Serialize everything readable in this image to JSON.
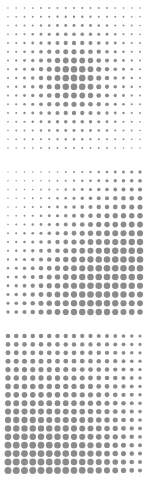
{
  "document": {
    "title": "Dot Matrix Panels",
    "background_color": "#ffffff",
    "width": 150,
    "height": 489,
    "panel_count": 3
  },
  "chart_data": [
    {
      "type": "heatmap",
      "title": "Panel 1 — Concentric Radial Dot Matrix",
      "subtitle": "",
      "xlabel": "",
      "ylabel": "",
      "grid": false,
      "legend": "none",
      "marker": "circle",
      "marker_color": "#8c8c8c",
      "rows": 17,
      "cols": 17,
      "x": [
        1,
        2,
        3,
        4,
        5,
        6,
        7,
        8,
        9,
        10,
        11,
        12,
        13,
        14,
        15,
        16,
        17
      ],
      "y": [
        1,
        2,
        3,
        4,
        5,
        6,
        7,
        8,
        9,
        10,
        11,
        12,
        13,
        14,
        15,
        16,
        17
      ],
      "value_range": [
        0.08,
        1.0
      ],
      "encoding": "marker size proportional to value",
      "pattern": "radial-peak-center",
      "values": [
        [
          0.1,
          0.11,
          0.12,
          0.13,
          0.15,
          0.16,
          0.17,
          0.18,
          0.18,
          0.18,
          0.17,
          0.16,
          0.15,
          0.13,
          0.12,
          0.11,
          0.1
        ],
        [
          0.11,
          0.13,
          0.15,
          0.17,
          0.19,
          0.21,
          0.23,
          0.24,
          0.25,
          0.24,
          0.23,
          0.21,
          0.19,
          0.17,
          0.15,
          0.13,
          0.11
        ],
        [
          0.12,
          0.15,
          0.18,
          0.21,
          0.25,
          0.28,
          0.31,
          0.33,
          0.34,
          0.33,
          0.31,
          0.28,
          0.25,
          0.21,
          0.18,
          0.15,
          0.12
        ],
        [
          0.13,
          0.17,
          0.21,
          0.26,
          0.32,
          0.37,
          0.41,
          0.44,
          0.45,
          0.44,
          0.41,
          0.37,
          0.32,
          0.26,
          0.21,
          0.17,
          0.13
        ],
        [
          0.15,
          0.19,
          0.25,
          0.32,
          0.4,
          0.47,
          0.53,
          0.57,
          0.58,
          0.57,
          0.53,
          0.47,
          0.4,
          0.32,
          0.25,
          0.19,
          0.15
        ],
        [
          0.16,
          0.21,
          0.28,
          0.37,
          0.47,
          0.57,
          0.65,
          0.7,
          0.72,
          0.7,
          0.65,
          0.57,
          0.47,
          0.37,
          0.28,
          0.21,
          0.16
        ],
        [
          0.17,
          0.23,
          0.31,
          0.41,
          0.53,
          0.65,
          0.76,
          0.83,
          0.85,
          0.83,
          0.76,
          0.65,
          0.53,
          0.41,
          0.31,
          0.23,
          0.17
        ],
        [
          0.18,
          0.24,
          0.33,
          0.44,
          0.57,
          0.7,
          0.83,
          0.95,
          0.98,
          0.95,
          0.83,
          0.7,
          0.57,
          0.44,
          0.33,
          0.24,
          0.18
        ],
        [
          0.18,
          0.25,
          0.34,
          0.45,
          0.58,
          0.72,
          0.85,
          0.98,
          1.0,
          0.98,
          0.85,
          0.72,
          0.58,
          0.45,
          0.34,
          0.25,
          0.18
        ],
        [
          0.18,
          0.24,
          0.33,
          0.44,
          0.57,
          0.7,
          0.83,
          0.95,
          0.98,
          0.95,
          0.83,
          0.7,
          0.57,
          0.44,
          0.33,
          0.24,
          0.18
        ],
        [
          0.17,
          0.23,
          0.31,
          0.41,
          0.53,
          0.65,
          0.76,
          0.83,
          0.85,
          0.83,
          0.76,
          0.65,
          0.53,
          0.41,
          0.31,
          0.23,
          0.17
        ],
        [
          0.16,
          0.21,
          0.28,
          0.37,
          0.47,
          0.57,
          0.65,
          0.7,
          0.72,
          0.7,
          0.65,
          0.57,
          0.47,
          0.37,
          0.28,
          0.21,
          0.16
        ],
        [
          0.15,
          0.19,
          0.25,
          0.32,
          0.4,
          0.47,
          0.53,
          0.57,
          0.58,
          0.57,
          0.53,
          0.47,
          0.4,
          0.32,
          0.25,
          0.19,
          0.15
        ],
        [
          0.13,
          0.17,
          0.21,
          0.26,
          0.32,
          0.37,
          0.41,
          0.44,
          0.45,
          0.44,
          0.41,
          0.37,
          0.32,
          0.26,
          0.21,
          0.17,
          0.13
        ],
        [
          0.12,
          0.15,
          0.18,
          0.21,
          0.25,
          0.28,
          0.31,
          0.33,
          0.34,
          0.33,
          0.31,
          0.28,
          0.25,
          0.21,
          0.18,
          0.15,
          0.12
        ],
        [
          0.11,
          0.13,
          0.15,
          0.17,
          0.19,
          0.21,
          0.23,
          0.24,
          0.25,
          0.24,
          0.23,
          0.21,
          0.19,
          0.17,
          0.15,
          0.13,
          0.11
        ],
        [
          0.1,
          0.11,
          0.12,
          0.13,
          0.15,
          0.16,
          0.17,
          0.18,
          0.18,
          0.18,
          0.17,
          0.16,
          0.15,
          0.13,
          0.12,
          0.11,
          0.1
        ]
      ]
    },
    {
      "type": "heatmap",
      "title": "Panel 2 — Diagonal Gradient Dot Matrix (top-left small to bottom-right large)",
      "subtitle": "",
      "xlabel": "",
      "ylabel": "",
      "grid": false,
      "legend": "none",
      "marker": "circle",
      "marker_color": "#8c8c8c",
      "rows": 17,
      "cols": 17,
      "x": [
        1,
        2,
        3,
        4,
        5,
        6,
        7,
        8,
        9,
        10,
        11,
        12,
        13,
        14,
        15,
        16,
        17
      ],
      "y": [
        1,
        2,
        3,
        4,
        5,
        6,
        7,
        8,
        9,
        10,
        11,
        12,
        13,
        14,
        15,
        16,
        17
      ],
      "value_range": [
        0.08,
        1.0
      ],
      "encoding": "marker size proportional to value",
      "pattern": "diagonal-increasing-to-bottom-right",
      "values": [
        [
          0.08,
          0.09,
          0.1,
          0.11,
          0.12,
          0.14,
          0.16,
          0.18,
          0.21,
          0.24,
          0.27,
          0.3,
          0.33,
          0.36,
          0.39,
          0.41,
          0.43
        ],
        [
          0.09,
          0.1,
          0.11,
          0.13,
          0.15,
          0.17,
          0.2,
          0.23,
          0.26,
          0.3,
          0.34,
          0.37,
          0.41,
          0.44,
          0.47,
          0.49,
          0.51
        ],
        [
          0.1,
          0.11,
          0.13,
          0.15,
          0.18,
          0.21,
          0.24,
          0.28,
          0.32,
          0.36,
          0.41,
          0.45,
          0.49,
          0.52,
          0.55,
          0.57,
          0.59
        ],
        [
          0.11,
          0.13,
          0.15,
          0.18,
          0.21,
          0.25,
          0.29,
          0.34,
          0.39,
          0.44,
          0.49,
          0.53,
          0.57,
          0.61,
          0.64,
          0.66,
          0.67
        ],
        [
          0.12,
          0.15,
          0.18,
          0.21,
          0.25,
          0.3,
          0.35,
          0.41,
          0.47,
          0.52,
          0.57,
          0.62,
          0.66,
          0.69,
          0.72,
          0.74,
          0.75
        ],
        [
          0.14,
          0.17,
          0.21,
          0.25,
          0.3,
          0.36,
          0.42,
          0.48,
          0.54,
          0.6,
          0.65,
          0.7,
          0.74,
          0.77,
          0.79,
          0.81,
          0.82
        ],
        [
          0.16,
          0.2,
          0.24,
          0.29,
          0.35,
          0.42,
          0.49,
          0.55,
          0.62,
          0.68,
          0.73,
          0.77,
          0.81,
          0.84,
          0.86,
          0.87,
          0.88
        ],
        [
          0.18,
          0.23,
          0.28,
          0.34,
          0.41,
          0.48,
          0.55,
          0.62,
          0.69,
          0.75,
          0.8,
          0.84,
          0.87,
          0.89,
          0.91,
          0.92,
          0.93
        ],
        [
          0.21,
          0.26,
          0.32,
          0.39,
          0.47,
          0.54,
          0.62,
          0.69,
          0.76,
          0.82,
          0.86,
          0.9,
          0.92,
          0.94,
          0.95,
          0.96,
          0.96
        ],
        [
          0.24,
          0.3,
          0.36,
          0.44,
          0.52,
          0.6,
          0.68,
          0.75,
          0.82,
          0.87,
          0.91,
          0.94,
          0.96,
          0.97,
          0.98,
          0.98,
          0.99
        ],
        [
          0.27,
          0.34,
          0.41,
          0.49,
          0.57,
          0.65,
          0.73,
          0.8,
          0.86,
          0.91,
          0.95,
          0.97,
          0.98,
          0.99,
          1.0,
          1.0,
          1.0
        ],
        [
          0.3,
          0.37,
          0.45,
          0.53,
          0.62,
          0.7,
          0.77,
          0.84,
          0.9,
          0.94,
          0.97,
          0.99,
          1.0,
          1.0,
          1.0,
          1.0,
          0.99
        ],
        [
          0.33,
          0.41,
          0.49,
          0.57,
          0.66,
          0.74,
          0.81,
          0.87,
          0.92,
          0.96,
          0.98,
          1.0,
          1.0,
          1.0,
          0.99,
          0.98,
          0.97
        ],
        [
          0.36,
          0.44,
          0.52,
          0.61,
          0.69,
          0.77,
          0.84,
          0.89,
          0.94,
          0.97,
          0.99,
          1.0,
          1.0,
          0.99,
          0.98,
          0.96,
          0.94
        ],
        [
          0.39,
          0.47,
          0.55,
          0.64,
          0.72,
          0.79,
          0.86,
          0.91,
          0.95,
          0.98,
          1.0,
          1.0,
          0.99,
          0.98,
          0.96,
          0.93,
          0.91
        ],
        [
          0.41,
          0.49,
          0.57,
          0.66,
          0.74,
          0.81,
          0.87,
          0.92,
          0.96,
          0.98,
          1.0,
          1.0,
          0.98,
          0.96,
          0.93,
          0.9,
          0.87
        ],
        [
          0.43,
          0.51,
          0.59,
          0.67,
          0.75,
          0.82,
          0.88,
          0.93,
          0.96,
          0.99,
          1.0,
          0.99,
          0.97,
          0.94,
          0.91,
          0.87,
          0.83
        ]
      ]
    },
    {
      "type": "heatmap",
      "title": "Panel 3 — Diagonal Gradient Dot Matrix (bottom-left large to top-right small)",
      "subtitle": "",
      "xlabel": "",
      "ylabel": "",
      "grid": false,
      "legend": "none",
      "marker": "circle",
      "marker_color": "#8c8c8c",
      "rows": 17,
      "cols": 17,
      "x": [
        1,
        2,
        3,
        4,
        5,
        6,
        7,
        8,
        9,
        10,
        11,
        12,
        13,
        14,
        15,
        16,
        17
      ],
      "y": [
        1,
        2,
        3,
        4,
        5,
        6,
        7,
        8,
        9,
        10,
        11,
        12,
        13,
        14,
        15,
        16,
        17
      ],
      "value_range": [
        0.2,
        1.0
      ],
      "encoding": "marker size proportional to value",
      "pattern": "diagonal-increasing-to-bottom-left",
      "values": [
        [
          0.52,
          0.52,
          0.51,
          0.51,
          0.5,
          0.5,
          0.49,
          0.48,
          0.47,
          0.46,
          0.45,
          0.43,
          0.41,
          0.38,
          0.34,
          0.28,
          0.22
        ],
        [
          0.55,
          0.55,
          0.54,
          0.54,
          0.53,
          0.53,
          0.52,
          0.51,
          0.5,
          0.49,
          0.47,
          0.46,
          0.43,
          0.4,
          0.36,
          0.3,
          0.23
        ],
        [
          0.58,
          0.58,
          0.57,
          0.57,
          0.56,
          0.56,
          0.55,
          0.54,
          0.53,
          0.52,
          0.5,
          0.48,
          0.45,
          0.42,
          0.37,
          0.31,
          0.24
        ],
        [
          0.61,
          0.61,
          0.61,
          0.6,
          0.6,
          0.59,
          0.58,
          0.57,
          0.56,
          0.55,
          0.53,
          0.51,
          0.48,
          0.44,
          0.39,
          0.33,
          0.25
        ],
        [
          0.64,
          0.64,
          0.64,
          0.63,
          0.63,
          0.62,
          0.62,
          0.61,
          0.59,
          0.58,
          0.56,
          0.53,
          0.5,
          0.46,
          0.41,
          0.34,
          0.26
        ],
        [
          0.68,
          0.68,
          0.67,
          0.67,
          0.66,
          0.66,
          0.65,
          0.64,
          0.63,
          0.61,
          0.59,
          0.56,
          0.53,
          0.49,
          0.43,
          0.36,
          0.27
        ],
        [
          0.72,
          0.71,
          0.71,
          0.7,
          0.7,
          0.69,
          0.68,
          0.67,
          0.66,
          0.64,
          0.62,
          0.59,
          0.56,
          0.51,
          0.45,
          0.38,
          0.29
        ],
        [
          0.75,
          0.75,
          0.74,
          0.74,
          0.73,
          0.73,
          0.72,
          0.71,
          0.69,
          0.67,
          0.65,
          0.62,
          0.58,
          0.54,
          0.47,
          0.39,
          0.3
        ],
        [
          0.79,
          0.79,
          0.78,
          0.78,
          0.77,
          0.76,
          0.75,
          0.74,
          0.73,
          0.71,
          0.68,
          0.65,
          0.61,
          0.56,
          0.5,
          0.41,
          0.31
        ],
        [
          0.83,
          0.82,
          0.82,
          0.81,
          0.81,
          0.8,
          0.79,
          0.78,
          0.76,
          0.74,
          0.71,
          0.68,
          0.64,
          0.59,
          0.52,
          0.43,
          0.33
        ],
        [
          0.86,
          0.86,
          0.85,
          0.85,
          0.84,
          0.83,
          0.82,
          0.81,
          0.79,
          0.77,
          0.75,
          0.71,
          0.67,
          0.61,
          0.54,
          0.45,
          0.34
        ],
        [
          0.9,
          0.89,
          0.89,
          0.88,
          0.87,
          0.87,
          0.86,
          0.84,
          0.83,
          0.8,
          0.78,
          0.74,
          0.7,
          0.64,
          0.56,
          0.47,
          0.36
        ],
        [
          0.93,
          0.93,
          0.92,
          0.91,
          0.91,
          0.9,
          0.89,
          0.87,
          0.86,
          0.83,
          0.81,
          0.77,
          0.72,
          0.66,
          0.58,
          0.48,
          0.37
        ],
        [
          0.96,
          0.96,
          0.95,
          0.94,
          0.94,
          0.93,
          0.92,
          0.9,
          0.88,
          0.86,
          0.83,
          0.8,
          0.75,
          0.69,
          0.61,
          0.5,
          0.38
        ],
        [
          0.98,
          0.98,
          0.97,
          0.97,
          0.96,
          0.95,
          0.94,
          0.93,
          0.91,
          0.89,
          0.86,
          0.82,
          0.77,
          0.71,
          0.63,
          0.52,
          0.39
        ],
        [
          1.0,
          0.99,
          0.99,
          0.98,
          0.98,
          0.97,
          0.96,
          0.95,
          0.93,
          0.91,
          0.88,
          0.84,
          0.79,
          0.73,
          0.64,
          0.53,
          0.4
        ],
        [
          1.0,
          1.0,
          1.0,
          0.99,
          0.99,
          0.98,
          0.97,
          0.96,
          0.94,
          0.92,
          0.89,
          0.85,
          0.81,
          0.74,
          0.65,
          0.54,
          0.41
        ]
      ]
    }
  ],
  "panels": [
    {
      "id": "panel-1",
      "name": "concentric-dot-matrix",
      "origin_x": 8,
      "origin_y": 8,
      "spacing_x": 8.25,
      "spacing_y": 8.75,
      "min_radius": 0.7,
      "max_radius": 3.4,
      "color": "#8c8c8c"
    },
    {
      "id": "panel-2",
      "name": "diagonal-dot-matrix-down-right",
      "origin_x": 8,
      "origin_y": 9,
      "spacing_x": 8.25,
      "spacing_y": 8.75,
      "min_radius": 0.6,
      "max_radius": 3.3,
      "color": "#8c8c8c"
    },
    {
      "id": "panel-3",
      "name": "diagonal-dot-matrix-down-left",
      "origin_x": 8,
      "origin_y": 10,
      "spacing_x": 8.25,
      "spacing_y": 8.4,
      "min_radius": 1.5,
      "max_radius": 3.5,
      "color": "#8c8c8c"
    }
  ]
}
